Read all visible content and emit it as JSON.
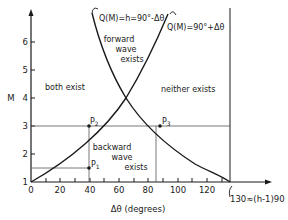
{
  "figure": {
    "y_axis_label": "M",
    "x_axis_label": "Δθ (degrees)",
    "y_ticks": [
      "1",
      "2",
      "3",
      "4",
      "5",
      "6"
    ],
    "x_ticks": [
      "0",
      "20",
      "40",
      "60",
      "80",
      "100",
      "120"
    ],
    "x_limit_label": "130≈(h-1)90",
    "curve_left_label": "Q(M)=h=90°-Δθ",
    "curve_right_label": "Q(M)=90°+Δθ",
    "regions": {
      "top_line1": "forward",
      "top_line2": "wave",
      "top_line3": "exists",
      "left": "both exist",
      "right": "neither exists",
      "bottom_line1": "backward",
      "bottom_line2": "wave",
      "bottom_line3": "exists"
    },
    "points": {
      "p1": "P",
      "p1_sub": "1",
      "p2": "P",
      "p2_sub": "2",
      "p3": "P",
      "p3_sub": "3"
    },
    "colors": {
      "ink": "#1a1a1a",
      "guide": "#555555",
      "background": "#ffffff"
    }
  }
}
